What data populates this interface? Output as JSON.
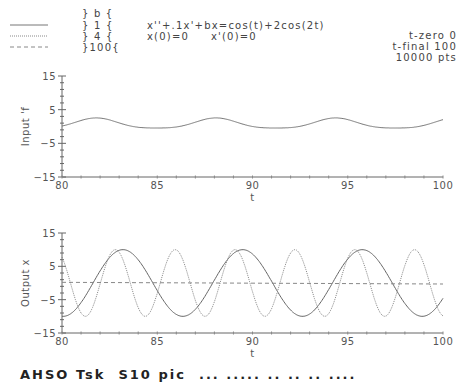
{
  "legend": {
    "header": "} b {",
    "entries": [
      {
        "style": "solid",
        "label": "} 1 {",
        "b": 1
      },
      {
        "style": "dotted",
        "label": "} 4 {",
        "b": 4
      },
      {
        "style": "dashed",
        "label": "}100{",
        "b": 100
      }
    ]
  },
  "equation": {
    "line1": "x''+.1x'+bx=cos(t)+2cos(2t)",
    "line2": "x(0)=0     x'(0)=0"
  },
  "params": {
    "t_zero": "t-zero 0",
    "t_final": "t-final 100",
    "points": "10000 pts"
  },
  "caption": "AHSO Tsk  S10 pic  ... ..... .. .. .. ....",
  "chart_data": [
    {
      "type": "line",
      "title": "",
      "xlabel": "t",
      "ylabel": "Input 'f",
      "xlim": [
        80,
        100
      ],
      "ylim": [
        -15,
        15
      ],
      "x_ticks": [
        "80",
        "85",
        "90",
        "95",
        "100"
      ],
      "y_ticks": [
        "15",
        "5",
        "-5",
        "-15"
      ],
      "grid": false,
      "series": [
        {
          "name": "f(t)=cos(t)+2cos(2t)",
          "style": "solid",
          "formula": "cos(t)+0.5*2*cos(2t) approx",
          "range": [
            -1.5,
            3
          ]
        }
      ]
    },
    {
      "type": "line",
      "title": "",
      "xlabel": "t",
      "ylabel": "Output x",
      "xlim": [
        80,
        100
      ],
      "ylim": [
        -15,
        15
      ],
      "x_ticks": [
        "80",
        "85",
        "90",
        "95",
        "100"
      ],
      "y_ticks": [
        "15",
        "5",
        "-5",
        "-15"
      ],
      "grid": false,
      "series": [
        {
          "name": "b=1",
          "style": "solid",
          "amplitude": 10,
          "period": 6.283,
          "peak_t": 83.2
        },
        {
          "name": "b=4",
          "style": "dotted",
          "amplitude": 10,
          "period": 3.1416,
          "peak_t": 82.8
        },
        {
          "name": "b=100",
          "style": "dashed",
          "value_start": 0.2,
          "value_end": -0.3
        }
      ]
    }
  ]
}
